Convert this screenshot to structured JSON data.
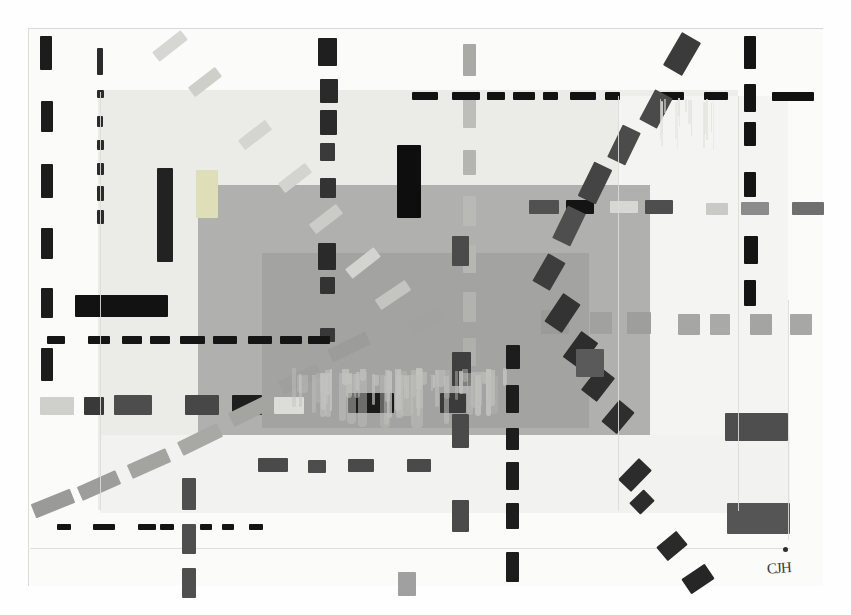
{
  "artwork": {
    "title": "Untitled Abstract Geometric Composition",
    "medium": "painting",
    "signature": "CJH",
    "canvas": {
      "width": 851,
      "height": 615
    },
    "palette": {
      "paper": "#fbfbfa",
      "page_background": "#ffffff",
      "light_gray_field": "#ededea",
      "mid_gray_field": "#b0b0ae",
      "dark_mid_gray_field": "#a3a3a1",
      "black_mark": "#1a1a1a",
      "dark_gray_mark": "#4a4a4a",
      "medium_gray_mark": "#8e8e8e",
      "pale_gray_mark": "#d2d2ce",
      "drip": "#c2c2bf"
    }
  },
  "fields": [
    {
      "name": "light-gray-field",
      "x": 98,
      "y": 90,
      "w": 640,
      "h": 420,
      "color": "#ededea"
    },
    {
      "name": "light-gray-field-left",
      "x": 98,
      "y": 90,
      "w": 520,
      "h": 420,
      "color": "#ebebe7"
    },
    {
      "name": "mid-gray-block",
      "x": 198,
      "y": 185,
      "w": 452,
      "h": 250,
      "color": "#b0b0ae"
    },
    {
      "name": "mid-gray-inner-block",
      "x": 262,
      "y": 253,
      "w": 327,
      "h": 175,
      "color": "#a3a3a1"
    },
    {
      "name": "right-wash",
      "x": 618,
      "y": 96,
      "w": 170,
      "h": 415,
      "color": "#f4f4f2"
    },
    {
      "name": "bottom-wash",
      "x": 100,
      "y": 435,
      "w": 690,
      "h": 78,
      "color": "#f2f2f0"
    }
  ],
  "marks": {
    "left_vertical_black_dashes": [
      {
        "x": 40,
        "y": 36,
        "w": 12,
        "h": 34,
        "color": "#1c1c1c"
      },
      {
        "x": 41,
        "y": 101,
        "w": 12,
        "h": 31,
        "color": "#1c1c1c"
      },
      {
        "x": 41,
        "y": 164,
        "w": 12,
        "h": 34,
        "color": "#1c1c1c"
      },
      {
        "x": 41,
        "y": 228,
        "w": 12,
        "h": 31,
        "color": "#1c1c1c"
      },
      {
        "x": 41,
        "y": 288,
        "w": 12,
        "h": 30,
        "color": "#1c1c1c"
      },
      {
        "x": 41,
        "y": 348,
        "w": 12,
        "h": 33,
        "color": "#1c1c1c"
      }
    ],
    "second_vertical_dotted_column": [
      {
        "x": 97,
        "y": 48,
        "w": 6,
        "h": 27,
        "color": "#2b2b2b"
      },
      {
        "x": 97,
        "y": 90,
        "w": 7,
        "h": 8,
        "color": "#2b2b2b"
      },
      {
        "x": 97,
        "y": 116,
        "w": 6,
        "h": 11,
        "color": "#2b2b2b"
      },
      {
        "x": 97,
        "y": 140,
        "w": 7,
        "h": 10,
        "color": "#2b2b2b"
      },
      {
        "x": 97,
        "y": 163,
        "w": 7,
        "h": 12,
        "color": "#2b2b2b"
      },
      {
        "x": 97,
        "y": 186,
        "w": 7,
        "h": 15,
        "color": "#2b2b2b"
      },
      {
        "x": 97,
        "y": 210,
        "w": 7,
        "h": 14,
        "color": "#2b2b2b"
      }
    ],
    "third_vertical_black_column": [
      {
        "x": 318,
        "y": 38,
        "w": 19,
        "h": 28,
        "color": "#1f1f1f"
      },
      {
        "x": 320,
        "y": 79,
        "w": 18,
        "h": 24,
        "color": "#2a2a2a"
      },
      {
        "x": 320,
        "y": 110,
        "w": 17,
        "h": 25,
        "color": "#2a2a2a"
      },
      {
        "x": 320,
        "y": 143,
        "w": 15,
        "h": 18,
        "color": "#3a3a3a"
      },
      {
        "x": 320,
        "y": 178,
        "w": 16,
        "h": 20,
        "color": "#333333"
      },
      {
        "x": 318,
        "y": 243,
        "w": 18,
        "h": 27,
        "color": "#2a2a2a"
      },
      {
        "x": 320,
        "y": 277,
        "w": 15,
        "h": 17,
        "color": "#333333"
      },
      {
        "x": 320,
        "y": 328,
        "w": 15,
        "h": 14,
        "color": "#383838"
      }
    ],
    "mid_vertical_pale_column": [
      {
        "x": 463,
        "y": 44,
        "w": 13,
        "h": 32,
        "color": "#a9a9a6"
      },
      {
        "x": 463,
        "y": 98,
        "w": 13,
        "h": 30,
        "color": "#bdbdba"
      },
      {
        "x": 463,
        "y": 150,
        "w": 13,
        "h": 25,
        "color": "#b4b4b1"
      },
      {
        "x": 463,
        "y": 196,
        "w": 13,
        "h": 30,
        "color": "#b9b9b6"
      },
      {
        "x": 463,
        "y": 245,
        "w": 13,
        "h": 28,
        "color": "#b6b6b3"
      },
      {
        "x": 463,
        "y": 292,
        "w": 13,
        "h": 30,
        "color": "#b2b2af"
      },
      {
        "x": 463,
        "y": 338,
        "w": 13,
        "h": 28,
        "color": "#afafac"
      }
    ],
    "right_vertical_black_column": [
      {
        "x": 744,
        "y": 36,
        "w": 12,
        "h": 33,
        "color": "#141414"
      },
      {
        "x": 744,
        "y": 84,
        "w": 12,
        "h": 28,
        "color": "#141414"
      },
      {
        "x": 744,
        "y": 122,
        "w": 12,
        "h": 24,
        "color": "#141414"
      },
      {
        "x": 744,
        "y": 172,
        "w": 12,
        "h": 25,
        "color": "#141414"
      },
      {
        "x": 744,
        "y": 236,
        "w": 14,
        "h": 28,
        "color": "#141414"
      },
      {
        "x": 744,
        "y": 280,
        "w": 12,
        "h": 26,
        "color": "#141414"
      }
    ],
    "bottom_center_vertical_dashed": [
      {
        "x": 506,
        "y": 345,
        "w": 14,
        "h": 24,
        "color": "#1d1d1d"
      },
      {
        "x": 506,
        "y": 385,
        "w": 13,
        "h": 28,
        "color": "#1d1d1d"
      },
      {
        "x": 506,
        "y": 428,
        "w": 13,
        "h": 22,
        "color": "#1d1d1d"
      },
      {
        "x": 506,
        "y": 462,
        "w": 13,
        "h": 28,
        "color": "#1d1d1d"
      },
      {
        "x": 506,
        "y": 503,
        "w": 13,
        "h": 26,
        "color": "#1d1d1d"
      },
      {
        "x": 506,
        "y": 552,
        "w": 13,
        "h": 30,
        "color": "#1d1d1d"
      }
    ],
    "lower_left_vertical_gray_dashes": [
      {
        "x": 182,
        "y": 478,
        "w": 14,
        "h": 32,
        "color": "#4f4f4f"
      },
      {
        "x": 182,
        "y": 524,
        "w": 14,
        "h": 30,
        "color": "#4f4f4f"
      },
      {
        "x": 182,
        "y": 568,
        "w": 14,
        "h": 30,
        "color": "#4f4f4f"
      }
    ],
    "vertical_gray_mid_right": [
      {
        "x": 452,
        "y": 236,
        "w": 17,
        "h": 30,
        "color": "#4b4b4b"
      },
      {
        "x": 452,
        "y": 352,
        "w": 19,
        "h": 34,
        "color": "#3f3f3f"
      },
      {
        "x": 452,
        "y": 414,
        "w": 17,
        "h": 34,
        "color": "#4a4a4a"
      },
      {
        "x": 452,
        "y": 500,
        "w": 17,
        "h": 32,
        "color": "#4a4a4a"
      }
    ],
    "horizontal_black_dash_line_top": [
      {
        "x": 412,
        "y": 92,
        "w": 26,
        "h": 8,
        "color": "#121212"
      },
      {
        "x": 452,
        "y": 92,
        "w": 28,
        "h": 8,
        "color": "#121212"
      },
      {
        "x": 487,
        "y": 92,
        "w": 18,
        "h": 8,
        "color": "#121212"
      },
      {
        "x": 513,
        "y": 92,
        "w": 22,
        "h": 8,
        "color": "#121212"
      },
      {
        "x": 543,
        "y": 92,
        "w": 15,
        "h": 8,
        "color": "#121212"
      },
      {
        "x": 570,
        "y": 92,
        "w": 26,
        "h": 8,
        "color": "#121212"
      },
      {
        "x": 605,
        "y": 92,
        "w": 15,
        "h": 8,
        "color": "#121212"
      },
      {
        "x": 660,
        "y": 92,
        "w": 24,
        "h": 8,
        "color": "#121212"
      },
      {
        "x": 704,
        "y": 92,
        "w": 24,
        "h": 8,
        "color": "#121212"
      },
      {
        "x": 772,
        "y": 92,
        "w": 42,
        "h": 9,
        "color": "#121212"
      }
    ],
    "horizontal_black_dash_line_mid": [
      {
        "x": 47,
        "y": 336,
        "w": 18,
        "h": 8,
        "color": "#151515"
      },
      {
        "x": 88,
        "y": 336,
        "w": 22,
        "h": 8,
        "color": "#151515"
      },
      {
        "x": 122,
        "y": 336,
        "w": 20,
        "h": 8,
        "color": "#151515"
      },
      {
        "x": 150,
        "y": 336,
        "w": 20,
        "h": 8,
        "color": "#151515"
      },
      {
        "x": 180,
        "y": 336,
        "w": 25,
        "h": 8,
        "color": "#151515"
      },
      {
        "x": 213,
        "y": 336,
        "w": 24,
        "h": 8,
        "color": "#151515"
      },
      {
        "x": 248,
        "y": 336,
        "w": 24,
        "h": 8,
        "color": "#151515"
      },
      {
        "x": 280,
        "y": 336,
        "w": 22,
        "h": 8,
        "color": "#151515"
      },
      {
        "x": 308,
        "y": 336,
        "w": 22,
        "h": 8,
        "color": "#151515"
      }
    ],
    "horizontal_gray_square_row": [
      {
        "x": 541,
        "y": 310,
        "w": 28,
        "h": 24,
        "color": "#9b9b99"
      },
      {
        "x": 590,
        "y": 312,
        "w": 22,
        "h": 22,
        "color": "#a1a19f"
      },
      {
        "x": 627,
        "y": 312,
        "w": 24,
        "h": 22,
        "color": "#9e9e9c"
      },
      {
        "x": 678,
        "y": 314,
        "w": 22,
        "h": 21,
        "color": "#a6a6a4"
      },
      {
        "x": 710,
        "y": 314,
        "w": 20,
        "h": 21,
        "color": "#a9a9a7"
      },
      {
        "x": 750,
        "y": 314,
        "w": 22,
        "h": 21,
        "color": "#a4a4a2"
      },
      {
        "x": 790,
        "y": 314,
        "w": 22,
        "h": 21,
        "color": "#a7a7a5"
      }
    ],
    "horizontal_dark_row_mid": [
      {
        "x": 40,
        "y": 397,
        "w": 34,
        "h": 18,
        "color": "#cfcfcc"
      },
      {
        "x": 84,
        "y": 397,
        "w": 20,
        "h": 18,
        "color": "#393939"
      },
      {
        "x": 114,
        "y": 395,
        "w": 38,
        "h": 20,
        "color": "#4d4d4d"
      },
      {
        "x": 185,
        "y": 395,
        "w": 34,
        "h": 20,
        "color": "#474747"
      },
      {
        "x": 232,
        "y": 395,
        "w": 30,
        "h": 20,
        "color": "#1e1e1e"
      },
      {
        "x": 274,
        "y": 397,
        "w": 30,
        "h": 17,
        "color": "#dcdcd8"
      },
      {
        "x": 348,
        "y": 393,
        "w": 46,
        "h": 20,
        "color": "#1b1b1b"
      },
      {
        "x": 440,
        "y": 393,
        "w": 26,
        "h": 20,
        "color": "#3b3b3b"
      }
    ],
    "horizontal_mid_dark_row_upper": [
      {
        "x": 529,
        "y": 200,
        "w": 30,
        "h": 14,
        "color": "#515151"
      },
      {
        "x": 566,
        "y": 200,
        "w": 28,
        "h": 14,
        "color": "#141414"
      },
      {
        "x": 610,
        "y": 201,
        "w": 28,
        "h": 12,
        "color": "#d7d7d3"
      },
      {
        "x": 645,
        "y": 200,
        "w": 28,
        "h": 14,
        "color": "#4e4e4e"
      },
      {
        "x": 706,
        "y": 203,
        "w": 22,
        "h": 12,
        "color": "#c9c9c6"
      },
      {
        "x": 741,
        "y": 202,
        "w": 28,
        "h": 13,
        "color": "#8b8b8b"
      },
      {
        "x": 792,
        "y": 202,
        "w": 32,
        "h": 13,
        "color": "#6f6f6f"
      }
    ],
    "horizontal_small_dash_row_lower": [
      {
        "x": 258,
        "y": 458,
        "w": 30,
        "h": 14,
        "color": "#4a4a4a"
      },
      {
        "x": 308,
        "y": 460,
        "w": 18,
        "h": 13,
        "color": "#4d4d4d"
      },
      {
        "x": 348,
        "y": 459,
        "w": 26,
        "h": 13,
        "color": "#4a4a4a"
      },
      {
        "x": 407,
        "y": 459,
        "w": 24,
        "h": 13,
        "color": "#4a4a4a"
      }
    ],
    "horizontal_black_dash_line_bottom": [
      {
        "x": 57,
        "y": 524,
        "w": 14,
        "h": 6,
        "color": "#141414"
      },
      {
        "x": 93,
        "y": 524,
        "w": 22,
        "h": 6,
        "color": "#141414"
      },
      {
        "x": 138,
        "y": 524,
        "w": 18,
        "h": 6,
        "color": "#141414"
      },
      {
        "x": 160,
        "y": 524,
        "w": 14,
        "h": 6,
        "color": "#141414"
      },
      {
        "x": 200,
        "y": 524,
        "w": 12,
        "h": 6,
        "color": "#141414"
      },
      {
        "x": 222,
        "y": 524,
        "w": 12,
        "h": 6,
        "color": "#141414"
      },
      {
        "x": 249,
        "y": 524,
        "w": 14,
        "h": 6,
        "color": "#141414"
      }
    ],
    "diagonal_pale_dashes_descending": [
      {
        "x": 152,
        "y": 40,
        "w": 36,
        "h": 12,
        "rot": 38,
        "color": "#d6d6d2"
      },
      {
        "x": 188,
        "y": 76,
        "w": 34,
        "h": 12,
        "rot": 38,
        "color": "#cfcfca"
      },
      {
        "x": 238,
        "y": 129,
        "w": 34,
        "h": 12,
        "rot": 38,
        "color": "#d4d4d0"
      },
      {
        "x": 278,
        "y": 172,
        "w": 34,
        "h": 12,
        "rot": 38,
        "color": "#d3d3cf"
      },
      {
        "x": 309,
        "y": 213,
        "w": 34,
        "h": 12,
        "rot": 38,
        "color": "#cbcbc7"
      },
      {
        "x": 345,
        "y": 257,
        "w": 36,
        "h": 12,
        "rot": 38,
        "color": "#d3d3cf"
      },
      {
        "x": 375,
        "y": 289,
        "w": 36,
        "h": 12,
        "rot": 34,
        "color": "#c4c4c0"
      },
      {
        "x": 407,
        "y": 315,
        "w": 38,
        "h": 13,
        "rot": 30,
        "color": "#a2a2a0"
      }
    ],
    "diagonal_gray_dashes_lower_left": [
      {
        "x": 328,
        "y": 340,
        "w": 42,
        "h": 14,
        "rot": 26,
        "color": "#9c9c9a"
      },
      {
        "x": 279,
        "y": 372,
        "w": 42,
        "h": 14,
        "rot": 26,
        "color": "#9f9f9d"
      },
      {
        "x": 229,
        "y": 403,
        "w": 44,
        "h": 15,
        "rot": 26,
        "color": "#a4a4a1"
      },
      {
        "x": 178,
        "y": 432,
        "w": 44,
        "h": 15,
        "rot": 26,
        "color": "#a8a8a5"
      },
      {
        "x": 128,
        "y": 456,
        "w": 42,
        "h": 15,
        "rot": 24,
        "color": "#a3a3a0"
      },
      {
        "x": 78,
        "y": 478,
        "w": 42,
        "h": 15,
        "rot": 24,
        "color": "#9d9d9b"
      },
      {
        "x": 32,
        "y": 496,
        "w": 42,
        "h": 15,
        "rot": 22,
        "color": "#9a9a98"
      }
    ],
    "diagonal_dark_dashes_descending_right": [
      {
        "x": 671,
        "y": 35,
        "w": 22,
        "h": 38,
        "rot": -30,
        "color": "#3b3b3b"
      },
      {
        "x": 646,
        "y": 92,
        "w": 20,
        "h": 34,
        "rot": -28,
        "color": "#4a4a4a"
      },
      {
        "x": 614,
        "y": 127,
        "w": 20,
        "h": 36,
        "rot": -26,
        "color": "#4b4b4b"
      },
      {
        "x": 585,
        "y": 164,
        "w": 20,
        "h": 38,
        "rot": -26,
        "color": "#444444"
      },
      {
        "x": 559,
        "y": 208,
        "w": 20,
        "h": 36,
        "rot": -26,
        "color": "#4e4e4e"
      },
      {
        "x": 539,
        "y": 256,
        "w": 20,
        "h": 32,
        "rot": -30,
        "color": "#3d3d3d"
      },
      {
        "x": 552,
        "y": 296,
        "w": 21,
        "h": 34,
        "rot": -34,
        "color": "#333333"
      },
      {
        "x": 570,
        "y": 334,
        "w": 21,
        "h": 32,
        "rot": -36,
        "color": "#2d2d2d"
      },
      {
        "x": 588,
        "y": 369,
        "w": 20,
        "h": 30,
        "rot": -38,
        "color": "#2f2f2f"
      },
      {
        "x": 608,
        "y": 403,
        "w": 20,
        "h": 28,
        "rot": -40,
        "color": "#2e2e2e"
      },
      {
        "x": 626,
        "y": 460,
        "w": 18,
        "h": 30,
        "rot": -44,
        "color": "#2c2c2c"
      },
      {
        "x": 634,
        "y": 492,
        "w": 16,
        "h": 20,
        "rot": -46,
        "color": "#2c2c2c"
      },
      {
        "x": 663,
        "y": 533,
        "w": 18,
        "h": 26,
        "rot": -50,
        "color": "#2a2a2a"
      },
      {
        "x": 689,
        "y": 565,
        "w": 18,
        "h": 28,
        "rot": -56,
        "color": "#262626"
      }
    ],
    "solid_blocks": [
      {
        "name": "tall-black-bar-left",
        "x": 157,
        "y": 168,
        "w": 16,
        "h": 94,
        "color": "#222222"
      },
      {
        "name": "black-bar-upper-mid",
        "x": 397,
        "y": 145,
        "w": 24,
        "h": 73,
        "color": "#0e0e0e"
      },
      {
        "name": "black-bar-left-low",
        "x": 75,
        "y": 295,
        "w": 93,
        "h": 22,
        "color": "#121212"
      },
      {
        "name": "dark-square-midright",
        "x": 576,
        "y": 349,
        "w": 28,
        "h": 28,
        "color": "#5a5a5a"
      },
      {
        "name": "dark-rect-lower-right1",
        "x": 725,
        "y": 413,
        "w": 63,
        "h": 28,
        "color": "#4e4e4e"
      },
      {
        "name": "dark-rect-lower-right2",
        "x": 727,
        "y": 503,
        "w": 63,
        "h": 31,
        "color": "#555555"
      },
      {
        "name": "pale-square-left-mid",
        "x": 196,
        "y": 170,
        "w": 22,
        "h": 48,
        "color": "#dedeb9"
      },
      {
        "name": "gray-square-lower-mid",
        "x": 398,
        "y": 572,
        "w": 18,
        "h": 24,
        "color": "#a0a0a0"
      }
    ],
    "drips": {
      "description": "vertical paint drip texture below mid-gray block",
      "region": {
        "x": 285,
        "y": 368,
        "w": 220,
        "h": 62
      }
    }
  }
}
